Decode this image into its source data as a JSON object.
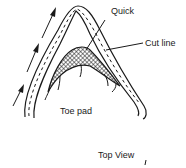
{
  "diagram": {
    "labels": {
      "quick": "Quick",
      "cut_line": "Cut line",
      "toe_pad": "Toe pad",
      "view": "Top View"
    },
    "colors": {
      "ink": "#1a1a1a",
      "background": "#ffffff"
    },
    "icons": [
      "direction-arrow-icon",
      "direction-arrow-icon",
      "direction-arrow-icon"
    ]
  }
}
